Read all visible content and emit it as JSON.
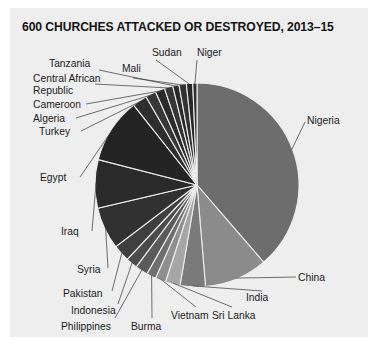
{
  "card": {
    "background": "#eeeeee"
  },
  "title": "600 CHURCHES ATTACKED OR DESTROYED, 2013–15",
  "chart_data": {
    "type": "pie",
    "title": "600 CHURCHES ATTACKED OR DESTROYED, 2013–15",
    "xlabel": "",
    "ylabel": "",
    "total": 600,
    "legend": "none",
    "grid": false,
    "labels_placement": "outside-with-leader-lines",
    "categories": [
      "Nigeria",
      "China",
      "India",
      "Sri Lanka",
      "Vietnam",
      "Burma",
      "Philippines",
      "Indonesia",
      "Pakistan",
      "Syria",
      "Iraq",
      "Egypt",
      "Turkey",
      "Algeria",
      "Cameroon",
      "Central African Republic",
      "Tanzania",
      "Mali",
      "Sudan",
      "Niger"
    ],
    "values": [
      232,
      60,
      24,
      14,
      10,
      9,
      12,
      11,
      16,
      40,
      46,
      62,
      14,
      10,
      9,
      8,
      6,
      7,
      6,
      4
    ],
    "colors": [
      "#6d6d6d",
      "#8b8b8b",
      "#7a7a7a",
      "#a6a6a6",
      "#8f8f8f",
      "#6f6f6f",
      "#5a5a5a",
      "#4b4b4b",
      "#3f3f3f",
      "#313131",
      "#2a2a2a",
      "#242424",
      "#2e2e2e",
      "#373737",
      "#2b2b2b",
      "#353535",
      "#2a2a2a",
      "#323232",
      "#282828",
      "#303030"
    ],
    "slice_border_color": "#eeeeee"
  },
  "labels": {
    "nigeria": "Nigeria",
    "china": "China",
    "india": "India",
    "sri_lanka": "Sri Lanka",
    "vietnam": "Vietnam",
    "burma": "Burma",
    "philippines": "Philippines",
    "indonesia": "Indonesia",
    "pakistan": "Pakistan",
    "syria": "Syria",
    "iraq": "Iraq",
    "egypt": "Egypt",
    "turkey": "Turkey",
    "algeria": "Algeria",
    "cameroon": "Cameroon",
    "car_line1": "Central African",
    "car_line2": "Republic",
    "tanzania": "Tanzania",
    "mali": "Mali",
    "sudan": "Sudan",
    "niger": "Niger"
  }
}
